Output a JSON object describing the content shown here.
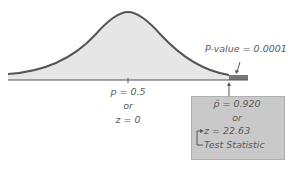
{
  "diagram": {
    "type": "normal-distribution-hypothesis-test",
    "curve_fill": "#e6e6e6",
    "curve_stroke": "#555555",
    "tail_fill": "#777777",
    "box_fill": "#c9c9c9",
    "center_label": {
      "line1": "p = 0.5",
      "line2": "or",
      "line3": "z = 0"
    },
    "pvalue_label": "P-value = 0.0001",
    "test_box": {
      "line1": "p̂ = 0.920",
      "line2": "or",
      "line3": "z = 22.63",
      "line4": "Test Statistic"
    }
  }
}
